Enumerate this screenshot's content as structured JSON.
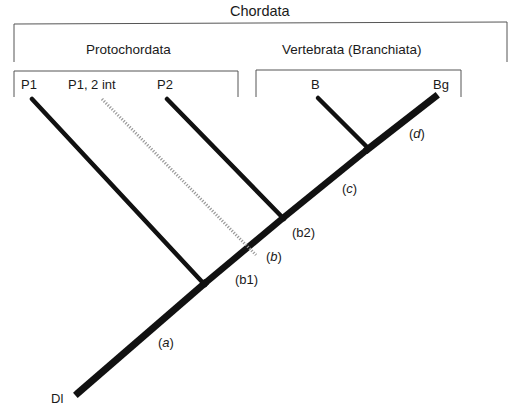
{
  "title": "Chordata",
  "groups": {
    "protochordata": "Protochordata",
    "vertebrata": "Vertebrata (Branchiata)"
  },
  "taxa": {
    "p1": "P1",
    "p1_2int": "P1, 2 int",
    "p2": "P2",
    "b": "B",
    "bg": "Bg",
    "dl": "Dl"
  },
  "nodes": {
    "a_open": "(",
    "a": "a",
    "a_close": ")",
    "b1": "(b1)",
    "b_open": "(",
    "b": "b",
    "b_close": ")",
    "b2": "(b2)",
    "c_open": "(",
    "c": "c",
    "c_close": ")",
    "d_open": "(",
    "d": "d",
    "d_close": ")"
  },
  "colors": {
    "line": "#111111",
    "bracket": "#555555",
    "dotted": "#9a9a9a"
  }
}
